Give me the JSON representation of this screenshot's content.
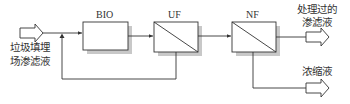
{
  "diagram": {
    "title": "",
    "nodes": [
      {
        "id": "bio",
        "label": "BIO"
      },
      {
        "id": "uf",
        "label": "UF"
      },
      {
        "id": "nf",
        "label": "NF"
      }
    ],
    "input": {
      "label_line1": "垃圾填埋",
      "label_line2": "场渗滤液"
    },
    "outputs": [
      {
        "id": "permeate",
        "label_line1": "处理过的",
        "label_line2": "渗滤液"
      },
      {
        "id": "concentrate",
        "label_line1": "浓缩液"
      }
    ],
    "edges": [
      {
        "from": "input",
        "to": "bio"
      },
      {
        "from": "bio",
        "to": "uf"
      },
      {
        "from": "uf",
        "to": "nf"
      },
      {
        "from": "uf",
        "to": "bio",
        "type": "recycle"
      },
      {
        "from": "nf",
        "to": "permeate"
      },
      {
        "from": "nf",
        "to": "concentrate"
      }
    ],
    "colors": {
      "line": "#333333",
      "shadow": "#c8c8c8",
      "box_fill": "#ffffff"
    }
  }
}
